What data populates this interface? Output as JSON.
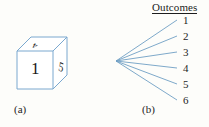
{
  "figure": {
    "background_color": "#fdfdfa",
    "line_color": "#6f9fc4",
    "text_color": "#1d1d1d"
  },
  "panel_a": {
    "caption": "(a)",
    "object": "die-cube",
    "faces": {
      "front": "1",
      "top": "4",
      "right": "5"
    },
    "edge_color": "#7aa8cf"
  },
  "panel_b": {
    "caption": "(b)",
    "title": "Outcomes",
    "outcomes": [
      "1",
      "2",
      "3",
      "4",
      "5",
      "6"
    ],
    "branch_count": 6,
    "origin": {
      "x": 21,
      "y": 61
    },
    "branch_ends": [
      {
        "x": 82,
        "y": 20
      },
      {
        "x": 82,
        "y": 36
      },
      {
        "x": 82,
        "y": 52
      },
      {
        "x": 82,
        "y": 68
      },
      {
        "x": 82,
        "y": 84
      },
      {
        "x": 82,
        "y": 100
      }
    ],
    "number_y": [
      15,
      31,
      47,
      63,
      79,
      95
    ]
  }
}
